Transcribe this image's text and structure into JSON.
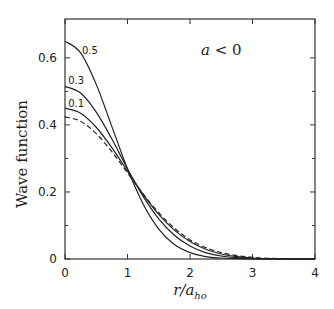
{
  "chart_data": {
    "type": "line",
    "title": "",
    "xlabel": "r/a_ho",
    "xlabel_main": "r/a",
    "xlabel_sub": "ho",
    "ylabel": "Wave function",
    "xlim": [
      0,
      4
    ],
    "ylim": [
      0,
      0.716
    ],
    "xticks": [
      0,
      1,
      2,
      3,
      4
    ],
    "xtick_labels": [
      "0",
      "1",
      "2",
      "3",
      "4"
    ],
    "yticks": [
      0,
      0.2,
      0.4,
      0.6
    ],
    "ytick_labels": [
      "0",
      "0.2",
      "0.4",
      "0.6"
    ],
    "y_minor_ticks": [
      0.1,
      0.3,
      0.5
    ],
    "x_minor_ticks": [
      0.5,
      1.5,
      2.5,
      3.5
    ],
    "grid": false,
    "legend": "none (inline curve labels)",
    "annotations": [
      {
        "text": "a < 0",
        "x": 2.5,
        "y": 0.625
      }
    ],
    "x": [
      0,
      0.25,
      0.5,
      0.75,
      1.0,
      1.25,
      1.5,
      1.75,
      2.0,
      2.25,
      2.5,
      2.75,
      3.0,
      3.25,
      3.5,
      3.75,
      4.0
    ],
    "series": [
      {
        "name": "0.5",
        "style": "solid",
        "label_pos": [
          0.27,
          0.625
        ],
        "values": [
          0.65,
          0.615,
          0.521,
          0.395,
          0.269,
          0.164,
          0.089,
          0.043,
          0.019,
          0.007,
          0.003,
          0.001,
          0.0,
          0.0,
          0.0,
          0.0,
          0.0
        ]
      },
      {
        "name": "0.3",
        "style": "solid",
        "label_pos": [
          0.05,
          0.535
        ],
        "values": [
          0.515,
          0.495,
          0.438,
          0.358,
          0.269,
          0.187,
          0.12,
          0.071,
          0.039,
          0.019,
          0.009,
          0.004,
          0.001,
          0.0,
          0.0,
          0.0,
          0.0
        ]
      },
      {
        "name": "0.1",
        "style": "solid",
        "label_pos": [
          0.05,
          0.465
        ],
        "values": [
          0.45,
          0.435,
          0.393,
          0.332,
          0.262,
          0.193,
          0.133,
          0.086,
          0.052,
          0.029,
          0.015,
          0.007,
          0.003,
          0.001,
          0.001,
          0.0,
          0.0
        ]
      },
      {
        "name": "0 (ideal gas)",
        "style": "dashed",
        "label_pos": null,
        "values": [
          0.424,
          0.411,
          0.374,
          0.32,
          0.257,
          0.194,
          0.138,
          0.092,
          0.057,
          0.034,
          0.019,
          0.01,
          0.005,
          0.002,
          0.001,
          0.0,
          0.0
        ]
      }
    ]
  }
}
